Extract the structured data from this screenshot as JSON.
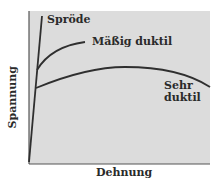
{
  "diagram": {
    "type": "stress-strain-curves",
    "x_axis_label": "Dehnung",
    "y_axis_label": "Spannung",
    "curves": [
      {
        "id": "sprode",
        "label": "Spröde"
      },
      {
        "id": "maessig",
        "label": "Mäßig duktil"
      },
      {
        "id": "sehr",
        "label_line1": "Sehr",
        "label_line2": "duktil"
      }
    ],
    "colors": {
      "plot_background": "#dcdcdc",
      "curve": "#2f2f2f",
      "text": "#2a2a2a"
    }
  }
}
